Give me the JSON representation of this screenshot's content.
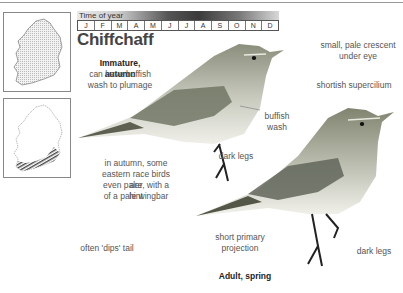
{
  "header": {
    "time_label": "Time of year",
    "months": [
      "J",
      "F",
      "M",
      "A",
      "M",
      "J",
      "J",
      "A",
      "S",
      "O",
      "N",
      "D"
    ]
  },
  "species": {
    "name": "Chiffchaff"
  },
  "maps": [
    {
      "name": "distribution-map-resident",
      "fill": "stippled grey"
    },
    {
      "name": "distribution-map-hatched",
      "fill": "hatched south coast"
    }
  ],
  "annotations": {
    "immature_heading": "Immature, autumn",
    "immature_line1": "can have buffish",
    "immature_line2": "wash to plumage",
    "buffish1": "buffish",
    "buffish2": "wash",
    "dark_legs_1": "dark legs",
    "eastern1": "in autumn, some",
    "eastern2": "eastern race birds are",
    "eastern3": "even paler, with a hint",
    "eastern4": "of a pale wingbar",
    "crescent1": "small, pale crescent",
    "crescent2": "under eye",
    "supercilium": "shortish supercilium",
    "dips_tail": "often 'dips' tail",
    "primary1": "short primary",
    "primary2": "projection",
    "dark_legs_2": "dark legs",
    "adult_heading": "Adult, spring"
  },
  "colors": {
    "bird_back": "#8a8f78",
    "bird_belly": "#eeeee6",
    "text": "#555555"
  }
}
